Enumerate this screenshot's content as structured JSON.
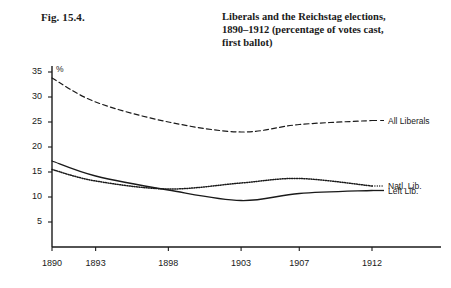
{
  "figure": {
    "number": "Fig. 15.4.",
    "title_lines": [
      "Liberals and the Reichstag elections,",
      "1890–1912 (percentage of votes cast,",
      "first ballot)"
    ]
  },
  "chart_data": {
    "type": "line",
    "xlabel": "",
    "ylabel": "%",
    "unit_label": "%",
    "categories": [
      "1890",
      "1893",
      "1898",
      "1903",
      "1907",
      "1912"
    ],
    "x": [
      1890,
      1893,
      1898,
      1903,
      1907,
      1912
    ],
    "xtick_labels": [
      "1890",
      "1893",
      "1898",
      "1903",
      "1907",
      "1912"
    ],
    "ytick_labels": [
      "5",
      "10",
      "15",
      "20",
      "25",
      "30",
      "35"
    ],
    "yticks": [
      5,
      10,
      15,
      20,
      25,
      30,
      35
    ],
    "ylim": [
      0,
      36
    ],
    "xlim": [
      1890,
      1912
    ],
    "grid": false,
    "legend": "inline-right-of-line-ends",
    "series": [
      {
        "name": "All Liberals",
        "label": "All Liberals",
        "style": "dashed",
        "values": [
          33.8,
          29.0,
          25.0,
          23.0,
          24.5,
          25.3
        ]
      },
      {
        "name": "Natl. Lib.",
        "label": "Natl. Lib.",
        "style": "dotted",
        "values": [
          15.5,
          13.2,
          11.6,
          12.8,
          13.7,
          12.2
        ]
      },
      {
        "name": "Left Lib.",
        "label": "Left Lib.",
        "style": "solid",
        "values": [
          17.2,
          14.2,
          11.4,
          9.3,
          10.7,
          11.3
        ]
      }
    ]
  },
  "colors": {
    "ink": "#1a1a1a",
    "background": "#ffffff",
    "axis": "#1a1a1a"
  }
}
